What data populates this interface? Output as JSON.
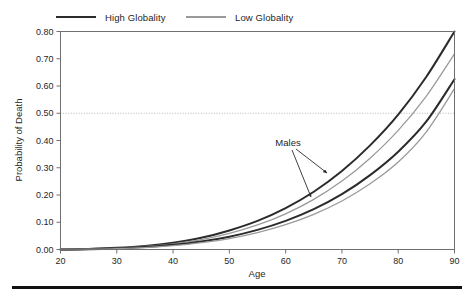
{
  "figure": {
    "background_color": "#ffffff",
    "frame_color": "#6f6f6f",
    "bottom_rule_color": "#111111"
  },
  "legend": {
    "position": "top",
    "entries": [
      {
        "label": "High Globality",
        "color": "#2b2b2b",
        "line_width": 2.6,
        "style": "solid"
      },
      {
        "label": "Low Globality",
        "color": "#9a9a9a",
        "line_width": 1.3,
        "style": "solid"
      }
    ]
  },
  "annotations": [
    {
      "name": "males-label",
      "text": "Males",
      "x_px": 288,
      "y_px": 143,
      "arrows": [
        {
          "from_x_px": 296,
          "from_y_px": 149,
          "to_x_px": 327,
          "to_y_px": 173
        },
        {
          "from_x_px": 292,
          "from_y_px": 150,
          "to_x_px": 311,
          "to_y_px": 197
        }
      ]
    }
  ],
  "reference_lines": [
    {
      "name": "half-probability",
      "axis": "y",
      "value": 0.5,
      "style": "dotted",
      "color": "#b5b5b5"
    }
  ],
  "chart_data": {
    "type": "line",
    "title": "",
    "xlabel": "Age",
    "ylabel": "Probability of Death",
    "xlim": [
      20,
      90
    ],
    "ylim": [
      0.0,
      0.8
    ],
    "xticks": [
      20,
      30,
      40,
      50,
      60,
      70,
      80,
      90
    ],
    "xticklabels": [
      "20",
      "30",
      "40",
      "50",
      "60",
      "70",
      "80",
      "90"
    ],
    "yticks": [
      0.0,
      0.1,
      0.2,
      0.3,
      0.4,
      0.5,
      0.6,
      0.7,
      0.8
    ],
    "yticklabels": [
      "0.00",
      "0.10",
      "0.20",
      "0.30",
      "0.40",
      "0.50",
      "0.60",
      "0.70",
      "0.80"
    ],
    "grid": false,
    "legend_position": "top",
    "x": [
      20,
      25,
      30,
      35,
      40,
      45,
      50,
      55,
      60,
      65,
      70,
      75,
      80,
      85,
      90
    ],
    "series": [
      {
        "name": "Males, High Globality",
        "group": "Males",
        "legend": "High Globality",
        "color": "#2b2b2b",
        "line_width": 2.0,
        "values": [
          0.0,
          0.002,
          0.006,
          0.013,
          0.025,
          0.043,
          0.07,
          0.105,
          0.152,
          0.212,
          0.288,
          0.382,
          0.495,
          0.634,
          0.8
        ]
      },
      {
        "name": "Males, Low Globality",
        "group": "Males",
        "legend": "Low Globality",
        "color": "#9a9a9a",
        "line_width": 1.3,
        "values": [
          0.0,
          0.002,
          0.005,
          0.011,
          0.021,
          0.036,
          0.059,
          0.09,
          0.131,
          0.184,
          0.251,
          0.335,
          0.437,
          0.563,
          0.718
        ]
      },
      {
        "name": "Females, High Globality",
        "group": "Females",
        "legend": "High Globality",
        "color": "#2b2b2b",
        "line_width": 2.0,
        "values": [
          0.0,
          0.001,
          0.004,
          0.009,
          0.017,
          0.029,
          0.047,
          0.072,
          0.105,
          0.148,
          0.203,
          0.273,
          0.359,
          0.47,
          0.625
        ]
      },
      {
        "name": "Females, Low Globality",
        "group": "Females",
        "legend": "Low Globality",
        "color": "#9a9a9a",
        "line_width": 1.3,
        "values": [
          0.0,
          0.001,
          0.003,
          0.007,
          0.014,
          0.025,
          0.04,
          0.062,
          0.091,
          0.129,
          0.178,
          0.241,
          0.321,
          0.432,
          0.59
        ]
      }
    ]
  }
}
